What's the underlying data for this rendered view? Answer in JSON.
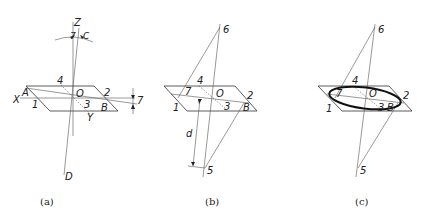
{
  "figure": {
    "panels": [
      {
        "id": "a",
        "caption": "(a)",
        "labels": {
          "Z": "Z",
          "gamma_top": "7",
          "C": "C",
          "four": "4",
          "O": "O",
          "two": "2",
          "gamma_right": "7",
          "A": "A",
          "X": "X",
          "one": "1",
          "three": "3",
          "B": "B",
          "Y": "Y",
          "D": "D"
        }
      },
      {
        "id": "b",
        "caption": "(b)",
        "labels": {
          "six": "6",
          "four": "4",
          "seven": "7",
          "O": "O",
          "two": "2",
          "one": "1",
          "three": "3",
          "B": "B",
          "d": "d",
          "five": "5"
        }
      },
      {
        "id": "c",
        "caption": "(c)",
        "labels": {
          "six": "6",
          "four": "4",
          "seven": "7",
          "O": "O",
          "two": "2",
          "one": "1",
          "three": "3",
          "B": "B",
          "five": "5"
        }
      }
    ],
    "colors": {
      "line": "#333333",
      "ellipse": "#111111",
      "background": "#ffffff"
    }
  }
}
